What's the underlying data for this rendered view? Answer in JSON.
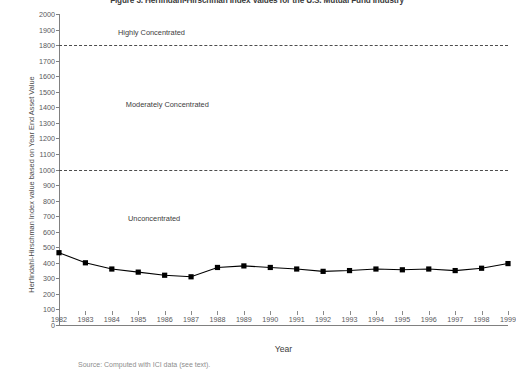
{
  "figure": {
    "title": "Figure 3. Herfindahl-Hirschman Index Values for the U.S. Mutual Fund Industry",
    "source": "Source: Computed with ICI data (see text)."
  },
  "chart_data": {
    "type": "line",
    "title": "Figure 3. Herfindahl-Hirschman Index Values for the U.S. Mutual Fund Industry",
    "xlabel": "Year",
    "ylabel": "Herfindahl-Hirschman Index value based on Year End Asset Value",
    "xlim": [
      1982,
      1999
    ],
    "ylim": [
      0,
      2000
    ],
    "ytick_step": 100,
    "grid": false,
    "legend": "none",
    "marker": "square",
    "line_color": "#000000",
    "marker_color": "#000000",
    "categories": [
      1982,
      1983,
      1984,
      1985,
      1986,
      1987,
      1988,
      1989,
      1990,
      1991,
      1992,
      1993,
      1994,
      1995,
      1996,
      1997,
      1998,
      1999
    ],
    "values": [
      465,
      400,
      360,
      340,
      320,
      310,
      370,
      380,
      370,
      360,
      345,
      350,
      360,
      355,
      360,
      350,
      365,
      395
    ],
    "yticks": [
      0,
      100,
      200,
      300,
      400,
      500,
      600,
      700,
      800,
      900,
      1000,
      1100,
      1200,
      1300,
      1400,
      1500,
      1600,
      1700,
      1800,
      1900,
      2000
    ],
    "xticks": [
      1982,
      1983,
      1984,
      1985,
      1986,
      1987,
      1988,
      1989,
      1990,
      1991,
      1992,
      1993,
      1994,
      1995,
      1996,
      1997,
      1998,
      1999
    ],
    "reference_lines": [
      {
        "value": 1800,
        "style": "dashed",
        "color": "#4d4d4d"
      },
      {
        "value": 1000,
        "style": "dashed",
        "color": "#4d4d4d"
      }
    ],
    "annotations": [
      {
        "text": "Highly Concentrated",
        "x": 1985.5,
        "y": 1885
      },
      {
        "text": "Moderately Concentrated",
        "x": 1986.1,
        "y": 1420
      },
      {
        "text": "Unconcentrated",
        "x": 1985.6,
        "y": 690
      }
    ]
  }
}
